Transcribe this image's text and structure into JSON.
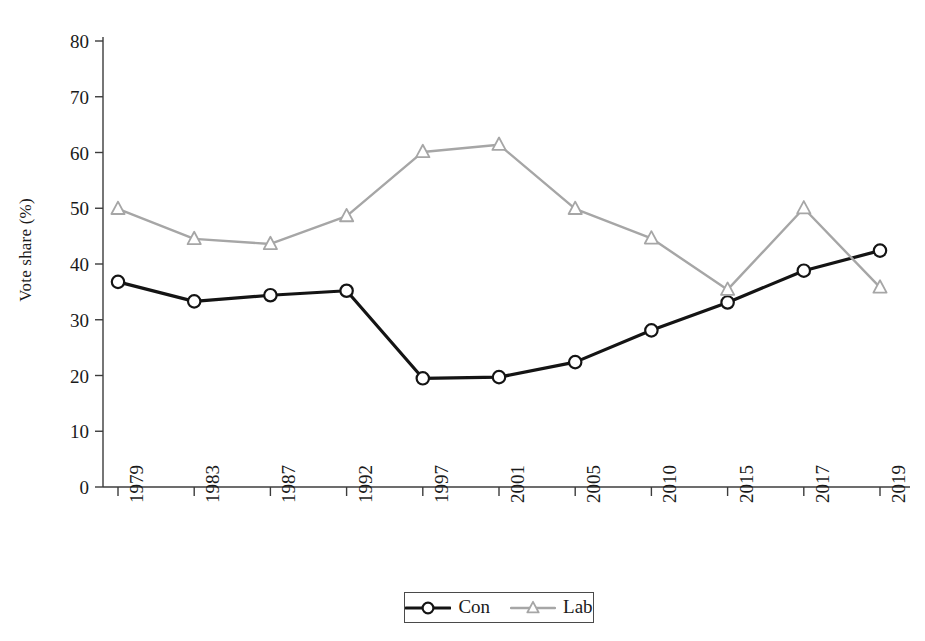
{
  "chart_data": {
    "type": "line",
    "title": "",
    "xlabel": "",
    "ylabel": "Vote share (%)",
    "categories": [
      "1979",
      "1983",
      "1987",
      "1992",
      "1997",
      "2001",
      "2005",
      "2010",
      "2015",
      "2017",
      "2019"
    ],
    "ylim": [
      0,
      80
    ],
    "yticks": [
      0,
      10,
      20,
      30,
      40,
      50,
      60,
      70,
      80
    ],
    "ytick_labels": [
      "0",
      "10",
      "20",
      "30",
      "40",
      "50",
      "60",
      "70",
      "80"
    ],
    "grid": false,
    "legend_position": "bottom-center",
    "series": [
      {
        "name": "Con",
        "color": "#141414",
        "marker": "circle",
        "values": [
          36.8,
          33.3,
          34.4,
          35.2,
          19.5,
          19.7,
          22.4,
          28.1,
          33.1,
          38.8,
          42.4
        ]
      },
      {
        "name": "Lab",
        "color": "#a6a6a6",
        "marker": "triangle",
        "values": [
          49.9,
          44.5,
          43.6,
          48.6,
          60.1,
          61.4,
          49.9,
          44.6,
          35.4,
          50.0,
          35.8
        ]
      }
    ]
  },
  "axis": {
    "color": "#3c3c3c"
  },
  "legend": {
    "entries": [
      {
        "label": "Con"
      },
      {
        "label": "Lab"
      }
    ]
  }
}
